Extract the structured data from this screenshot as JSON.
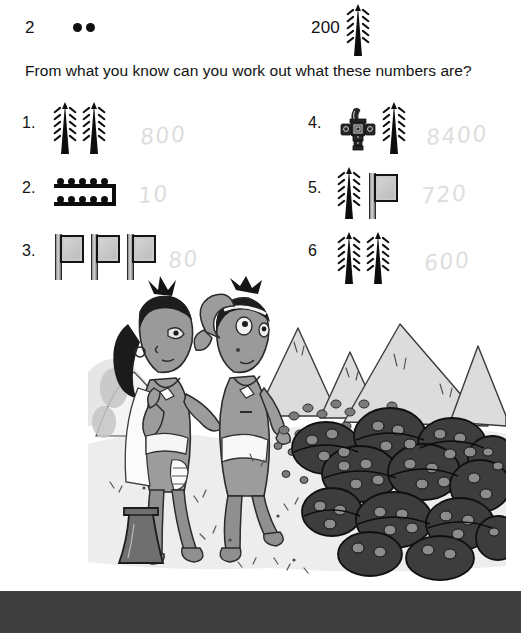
{
  "key": {
    "two": {
      "label": "2",
      "glyph": "dot-pair",
      "value": 2,
      "count": 2
    },
    "two_hundred": {
      "label": "200",
      "glyph": "feather",
      "value": 200,
      "count": 1
    }
  },
  "question": "From what you know can you work out what these numbers are?",
  "exercises": {
    "left": [
      {
        "number": "1.",
        "glyphs": [
          {
            "type": "feather",
            "value": 200
          },
          {
            "type": "feather",
            "value": 200
          }
        ],
        "answer": "800"
      },
      {
        "number": "2.",
        "glyphs": [
          {
            "type": "bar-of-ten",
            "value": 10,
            "dots_top": 5,
            "dots_bottom": 5
          }
        ],
        "answer": "10"
      },
      {
        "number": "3.",
        "glyphs": [
          {
            "type": "flag",
            "value": 20
          },
          {
            "type": "flag",
            "value": 20
          },
          {
            "type": "flag",
            "value": 20
          }
        ],
        "answer": "80"
      }
    ],
    "right": [
      {
        "number": "4.",
        "glyphs": [
          {
            "type": "pouch",
            "value": 8000
          },
          {
            "type": "feather",
            "value": 200
          }
        ],
        "answer": "8400"
      },
      {
        "number": "5.",
        "glyphs": [
          {
            "type": "feather",
            "value": 200
          },
          {
            "type": "flag",
            "value": 20
          }
        ],
        "answer": "720"
      },
      {
        "number": "6",
        "glyphs": [
          {
            "type": "feather",
            "value": 200
          },
          {
            "type": "feather",
            "value": 200
          }
        ],
        "answer": "600"
      }
    ]
  },
  "illustration": {
    "description": "Line-and-wash cartoon of two Mayan children standing on sandy ground, one shading her eyes, beside large heaps of cacao beans in baskets, with mountains in the background",
    "ink_color": "#2b2b2b",
    "wash_color": "#b9b9b9"
  },
  "footer": {
    "bar_color": "#3e3e3e"
  }
}
